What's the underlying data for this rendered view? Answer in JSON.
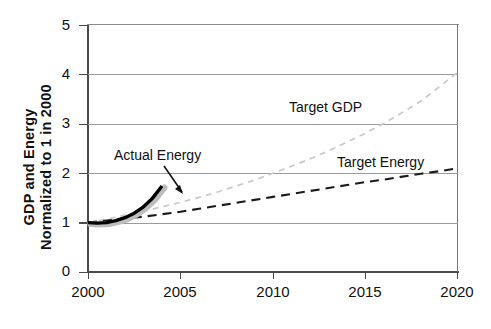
{
  "chart_data": {
    "type": "line",
    "title": "",
    "xlabel": "",
    "ylabel": "GDP and Energy\nNormalized to 1 in 2000",
    "xlim": [
      2000,
      2020
    ],
    "ylim": [
      0,
      5
    ],
    "xticks": [
      "2000",
      "2005",
      "2010",
      "2015",
      "2020"
    ],
    "yticks": [
      "0",
      "1",
      "2",
      "3",
      "4",
      "5"
    ],
    "grid": "horizontal gridlines at 1, 2, 3, 4",
    "legend": "inline annotations, no legend box",
    "series": [
      {
        "name": "Target GDP",
        "style": "dashed",
        "color": "#c9c9c9",
        "x": [
          2000,
          2001,
          2002,
          2003,
          2004,
          2005,
          2006,
          2007,
          2008,
          2009,
          2010,
          2011,
          2012,
          2013,
          2014,
          2015,
          2016,
          2017,
          2018,
          2019,
          2020
        ],
        "values": [
          1.0,
          1.07,
          1.15,
          1.23,
          1.32,
          1.41,
          1.51,
          1.62,
          1.74,
          1.86,
          2.0,
          2.14,
          2.29,
          2.45,
          2.63,
          2.81,
          3.01,
          3.23,
          3.46,
          3.75,
          4.05
        ]
      },
      {
        "name": "Target Energy",
        "style": "dashed",
        "color": "#1a1a1a",
        "x": [
          2000,
          2001,
          2002,
          2003,
          2004,
          2005,
          2006,
          2007,
          2008,
          2009,
          2010,
          2011,
          2012,
          2013,
          2014,
          2015,
          2016,
          2017,
          2018,
          2019,
          2020
        ],
        "values": [
          1.0,
          1.04,
          1.08,
          1.12,
          1.17,
          1.22,
          1.28,
          1.34,
          1.4,
          1.46,
          1.52,
          1.58,
          1.64,
          1.7,
          1.76,
          1.82,
          1.87,
          1.93,
          1.99,
          2.04,
          2.1
        ]
      },
      {
        "name": "Actual Energy",
        "style": "solid-thick",
        "color": "#000000",
        "x": [
          2000,
          2000.5,
          2001,
          2001.5,
          2002,
          2002.5,
          2003,
          2003.5,
          2004
        ],
        "values": [
          1.0,
          0.99,
          1.0,
          1.04,
          1.1,
          1.19,
          1.32,
          1.5,
          1.74
        ]
      }
    ],
    "annotations": [
      {
        "text": "Actual Energy",
        "points_to": "thick black solid curve end near 2004"
      },
      {
        "text": "Target GDP",
        "points_to": "light gray dashed curve"
      },
      {
        "text": "Target Energy",
        "points_to": "black dashed curve"
      }
    ]
  },
  "labels": {
    "ytitle": "GDP and Energy\nNormalized to 1 in 2000",
    "actual_energy": "Actual Energy",
    "target_gdp": "Target GDP",
    "target_energy": "Target Energy"
  },
  "axis": {
    "y": {
      "t0": "0",
      "t1": "1",
      "t2": "2",
      "t3": "3",
      "t4": "4",
      "t5": "5"
    },
    "x": {
      "t0": "2000",
      "t1": "2005",
      "t2": "2010",
      "t3": "2015",
      "t4": "2020"
    }
  },
  "colors": {
    "axis": "#4a4a4a",
    "grid": "#9b9b9b",
    "target_gdp": "#c9c9c9",
    "target_energy": "#1a1a1a",
    "actual_energy": "#000000",
    "actual_energy_shadow": "#bdbdbd"
  }
}
